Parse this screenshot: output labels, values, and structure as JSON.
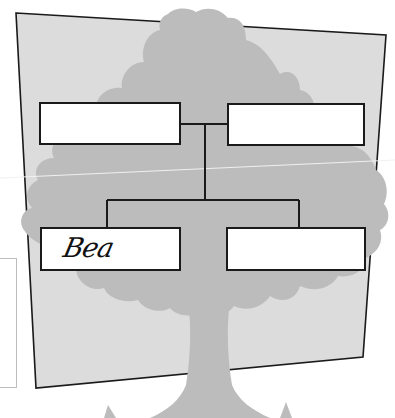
{
  "worksheet": {
    "title": "Family tree worksheet",
    "colors": {
      "page_background": "#ffffff",
      "panel_fill": "#dcdcdc",
      "tree_silhouette": "#bcbcbc",
      "outline": "#1a1a1a",
      "box_fill": "#ffffff"
    },
    "boxes": [
      {
        "position": "top-left",
        "label": ""
      },
      {
        "position": "top-right",
        "label": ""
      },
      {
        "position": "bottom-left",
        "label": "Bea"
      },
      {
        "position": "bottom-right",
        "label": ""
      }
    ]
  }
}
